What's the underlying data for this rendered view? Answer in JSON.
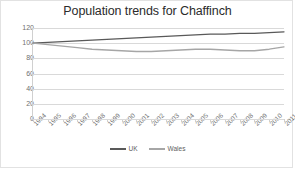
{
  "chart_data": {
    "type": "line",
    "title": "Population trends for Chaffinch",
    "xlabel": "",
    "ylabel": "",
    "ylim": [
      0,
      120
    ],
    "yticks": [
      0,
      20,
      40,
      60,
      80,
      100,
      120
    ],
    "grid": true,
    "legend_position": "bottom",
    "categories": [
      "1994",
      "1995",
      "1996",
      "1997",
      "1998",
      "1999",
      "2000",
      "2001",
      "2002",
      "2003",
      "2004",
      "2005",
      "2006",
      "2007",
      "2008",
      "2009",
      "2010",
      "2011"
    ],
    "series": [
      {
        "name": "UK",
        "color": "#595959",
        "values": [
          100,
          101,
          102,
          103,
          104,
          105,
          106,
          107,
          108,
          109,
          110,
          111,
          112,
          112,
          113,
          113,
          114,
          115
        ]
      },
      {
        "name": "Wales",
        "color": "#a6a6a6",
        "values": [
          100,
          98,
          96,
          94,
          92,
          91,
          90,
          89,
          89,
          90,
          91,
          92,
          92,
          91,
          90,
          90,
          92,
          95
        ]
      }
    ]
  },
  "legend": {
    "items": [
      {
        "label": "UK",
        "color": "#595959"
      },
      {
        "label": "Wales",
        "color": "#a6a6a6"
      }
    ]
  }
}
